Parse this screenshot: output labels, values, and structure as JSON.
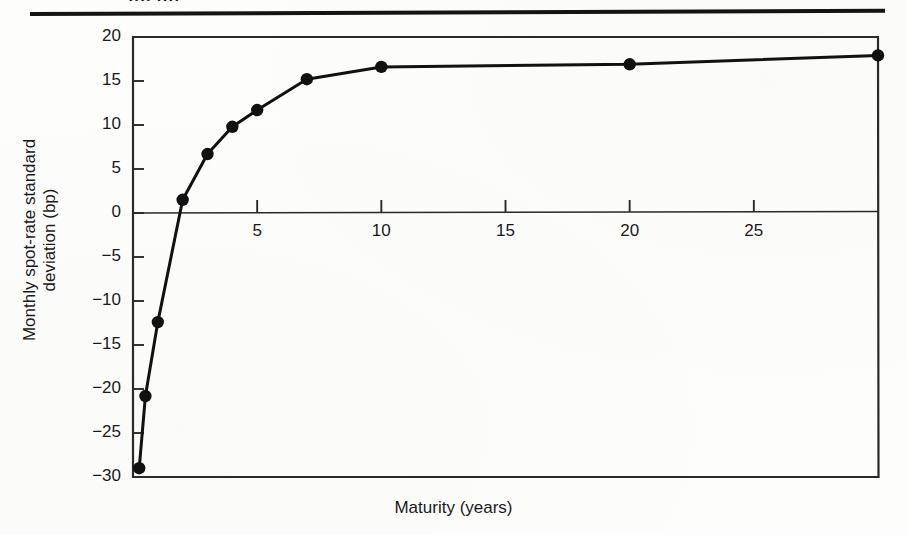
{
  "figure": {
    "clipped_caption_fragment": "ffff  ffff",
    "background_color": "#fdfdfc",
    "ink_color": "#141414"
  },
  "chart_data": {
    "type": "line",
    "title": "",
    "subtitle": "",
    "xlabel": "Maturity (years)",
    "ylabel": "Monthly spot-rate standard deviation (bp)",
    "ylabel_line1": "Monthly spot-rate standard",
    "ylabel_line2": "deviation (bp)",
    "xlim": [
      0,
      30
    ],
    "ylim": [
      -30,
      20
    ],
    "xticks": [
      5,
      10,
      15,
      20,
      25
    ],
    "xtick_labels": [
      "5",
      "10",
      "15",
      "20",
      "25"
    ],
    "yticks": [
      -30,
      -25,
      -20,
      -15,
      -10,
      -5,
      0,
      5,
      10,
      15,
      20
    ],
    "ytick_labels": [
      "-30",
      "-25",
      "-20",
      "-15",
      "-10",
      "-5",
      "0",
      "5",
      "10",
      "15",
      "20"
    ],
    "grid": false,
    "legend": null,
    "zero_line": true,
    "marker": "filled-circle",
    "marker_color": "#111111",
    "line_color": "#111111",
    "line_width_px": 3,
    "x": [
      0.25,
      0.5,
      1.0,
      2.0,
      3.0,
      4.0,
      5.0,
      7.0,
      10.0,
      20.0,
      30.0
    ],
    "y": [
      -29.0,
      -20.8,
      -12.4,
      1.5,
      6.7,
      9.8,
      11.7,
      15.2,
      16.6,
      16.9,
      17.9
    ],
    "points": [
      {
        "maturity": 0.25,
        "deviation": -29.0
      },
      {
        "maturity": 0.5,
        "deviation": -20.8
      },
      {
        "maturity": 1.0,
        "deviation": -12.4
      },
      {
        "maturity": 2.0,
        "deviation": 1.5
      },
      {
        "maturity": 3.0,
        "deviation": 6.7
      },
      {
        "maturity": 4.0,
        "deviation": 9.8
      },
      {
        "maturity": 5.0,
        "deviation": 11.7
      },
      {
        "maturity": 7.0,
        "deviation": 15.2
      },
      {
        "maturity": 10.0,
        "deviation": 16.6
      },
      {
        "maturity": 20.0,
        "deviation": 16.9
      },
      {
        "maturity": 30.0,
        "deviation": 17.9
      }
    ]
  }
}
